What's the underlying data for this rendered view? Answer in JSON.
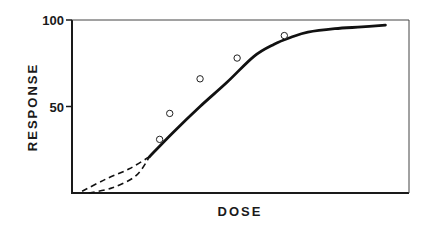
{
  "chart_data": {
    "type": "line",
    "title": "",
    "xlabel": "DOSE",
    "ylabel": "RESPONSE",
    "ylim": [
      0,
      100
    ],
    "yticks": [
      50,
      100
    ],
    "ytick_labels": [
      "50",
      "100"
    ],
    "xticks": [],
    "grid": false,
    "legend": null,
    "frame": "box",
    "series": [
      {
        "name": "fitted dose-response curve",
        "style": "solid",
        "x": [
          0.23,
          0.3,
          0.38,
          0.46,
          0.54,
          0.6,
          0.65,
          0.7,
          0.78,
          0.86,
          0.93
        ],
        "y": [
          21,
          35,
          50,
          64,
          79,
          86,
          90,
          93,
          95,
          96,
          97
        ]
      },
      {
        "name": "extrapolation (upper dashed)",
        "style": "dashed",
        "x": [
          0.03,
          0.1,
          0.17,
          0.23
        ],
        "y": [
          1,
          8,
          14,
          21
        ]
      },
      {
        "name": "extrapolation (lower dashed)",
        "style": "dashed",
        "x": [
          0.05,
          0.12,
          0.19,
          0.23
        ],
        "y": [
          0,
          3,
          10,
          21
        ]
      },
      {
        "name": "observed responses",
        "style": "markers-open-circle",
        "x": [
          0.26,
          0.29,
          0.38,
          0.49,
          0.63
        ],
        "y": [
          31,
          46,
          66,
          78,
          91
        ]
      }
    ]
  }
}
